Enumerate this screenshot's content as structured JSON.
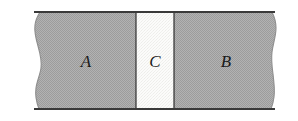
{
  "figure": {
    "type": "cross-section-diagram",
    "background_color": "#ffffff",
    "top_edge_line_color": "#3a3a3a",
    "bottom_edge_line_color": "#3a3a3a",
    "divider_line_color": "#2e2e2e",
    "geometry": {
      "slab_top_y": 12,
      "slab_bottom_y": 109,
      "left_torn_edge_x": 33,
      "right_torn_edge_x": 276,
      "region_c_left_x": 136,
      "region_c_right_x": 174
    },
    "regions": [
      {
        "id": "region-a",
        "label": "A",
        "fill_color": "#a9a9a9",
        "label_x": 86,
        "label_y": 61
      },
      {
        "id": "region-c",
        "label": "C",
        "fill_color": "#f7f7f5",
        "label_x": 155,
        "label_y": 61
      },
      {
        "id": "region-b",
        "label": "B",
        "fill_color": "#a9a9a9",
        "label_x": 226,
        "label_y": 61
      }
    ]
  }
}
